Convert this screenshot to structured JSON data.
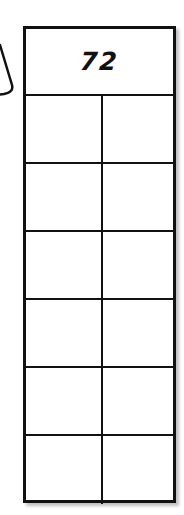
{
  "diagram": {
    "header_value": "72",
    "rows": [
      {
        "left": "",
        "right": ""
      },
      {
        "left": "",
        "right": ""
      },
      {
        "left": "",
        "right": ""
      },
      {
        "left": "",
        "right": ""
      },
      {
        "left": "",
        "right": ""
      },
      {
        "left": "",
        "right": ""
      }
    ],
    "colors": {
      "line": "#111111",
      "background": "#ffffff"
    }
  }
}
